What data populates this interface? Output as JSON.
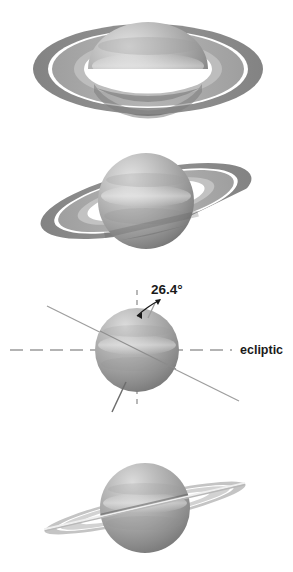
{
  "figure": {
    "background_color": "#ffffff",
    "width": 293,
    "height": 572
  },
  "annotations": {
    "tilt_angle": "26.4°",
    "ecliptic_label": "ecliptic"
  },
  "colors": {
    "planet_light": "#d8d8d8",
    "planet_mid": "#a9a9a9",
    "planet_dark": "#7d7d7d",
    "planet_shadow": "#636363",
    "ring_outer": "#8c8c8c",
    "ring_inner": "#a6a6a6",
    "ring_gap": "#ffffff",
    "ring_thin": "#c9c9c9",
    "line_solid": "#8f8f8f",
    "line_dashed": "#9a9a9a",
    "arrow": "#1a1a1a",
    "text": "#1a1a1a"
  },
  "panels": [
    {
      "id": "panel-rings-open-north",
      "label": "Rings fully open, northern face visible",
      "ring_tilt_deg": 0,
      "ring_openness": "wide",
      "center": {
        "x": 148,
        "y": 69
      },
      "globe_radius_x": 60,
      "globe_radius_y": 47
    },
    {
      "id": "panel-rings-intermediate",
      "label": "Rings at intermediate opening, tilted",
      "ring_tilt_deg": -13,
      "ring_openness": "medium",
      "center": {
        "x": 146,
        "y": 201
      },
      "globe_radius_x": 48,
      "globe_radius_y": 48
    },
    {
      "id": "panel-axis-tilt-diagram",
      "label": "Axial tilt relative to ecliptic",
      "ring_tilt_deg": -26.4,
      "ring_openness": "edge-on-diagram",
      "center": {
        "x": 137,
        "y": 350
      },
      "globe_radius_x": 42,
      "globe_radius_y": 42
    },
    {
      "id": "panel-rings-edge-on",
      "label": "Rings nearly edge-on",
      "ring_tilt_deg": -13,
      "ring_openness": "narrow",
      "center": {
        "x": 145,
        "y": 508
      },
      "globe_radius_x": 45,
      "globe_radius_y": 45
    }
  ]
}
